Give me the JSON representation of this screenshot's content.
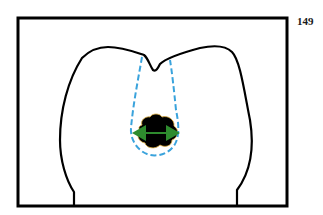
{
  "page": {
    "number": "149"
  },
  "figure": {
    "elements": {
      "frame": "rectangle-border",
      "tooth_outline": "molar-crown-outline",
      "lesion": "carious-lesion",
      "cone": "dashed-cone-outline",
      "arrow": "double-headed-arrow"
    },
    "colors": {
      "outline": "#000000",
      "cone": "#3aa3dc",
      "lesion": "#000000",
      "lesion_edge": "#e0b040",
      "arrow": "#2e8b2e"
    }
  }
}
